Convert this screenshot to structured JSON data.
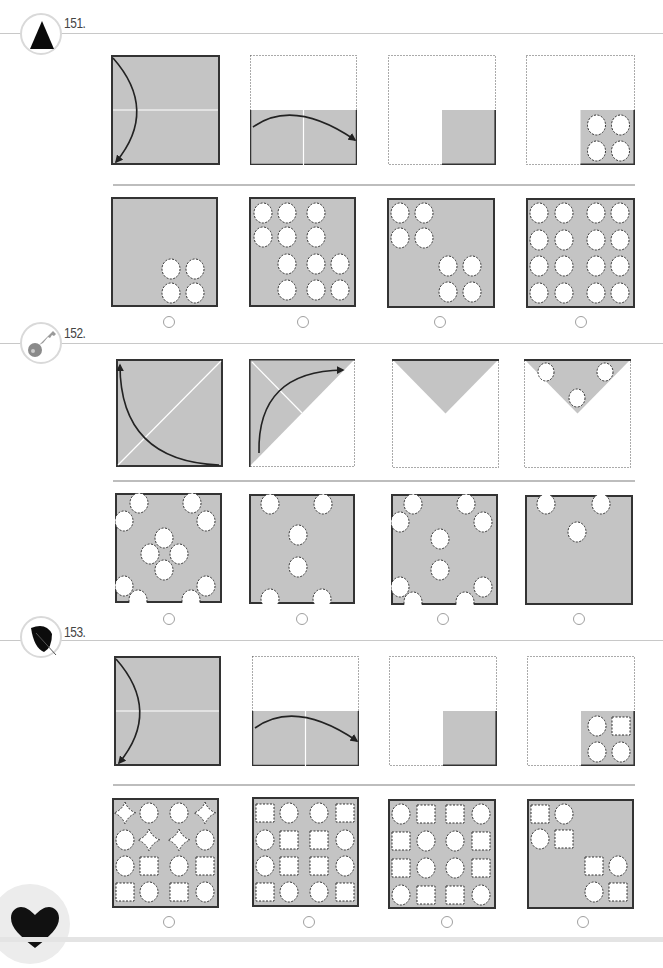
{
  "page": {
    "bg": "#ffffff",
    "paper_gray": "#c4c4c4",
    "ink": "#222222"
  },
  "questions": [
    {
      "number": "151.",
      "icon": "triangle-icon",
      "badge": {
        "x": 20,
        "y": 13
      },
      "num_pos": {
        "x": 64,
        "y": 23
      },
      "line_y": 33,
      "sequence": [
        {
          "type": "fold-h-down",
          "x": 111,
          "y": 55,
          "w": 109,
          "h": 110
        },
        {
          "type": "fold-v-right",
          "x": 250,
          "y": 55,
          "w": 107,
          "h": 110
        },
        {
          "type": "quarter",
          "x": 388,
          "y": 55,
          "w": 108,
          "h": 110
        },
        {
          "type": "quarter-holes",
          "x": 526,
          "y": 55,
          "w": 109,
          "h": 110,
          "holes": "cccc"
        }
      ],
      "sep_y": 184,
      "answers": [
        {
          "x": 111,
          "y": 197,
          "w": 107,
          "h": 110,
          "holes": [
            [
              60,
              72,
              "c"
            ],
            [
              84,
              72,
              "c"
            ],
            [
              60,
              96,
              "c"
            ],
            [
              84,
              96,
              "c"
            ]
          ]
        },
        {
          "x": 249,
          "y": 197,
          "w": 107,
          "h": 110,
          "holes": [
            [
              14,
              16,
              "c"
            ],
            [
              38,
              16,
              "c"
            ],
            [
              67,
              16,
              "c"
            ],
            [
              14,
              40,
              "c"
            ],
            [
              38,
              40,
              "c"
            ],
            [
              67,
              40,
              "c"
            ],
            [
              38,
              67,
              "c"
            ],
            [
              67,
              67,
              "c"
            ],
            [
              91,
              67,
              "c"
            ],
            [
              38,
              93,
              "c"
            ],
            [
              67,
              93,
              "c"
            ],
            [
              91,
              93,
              "c"
            ]
          ]
        },
        {
          "x": 387,
          "y": 198,
          "w": 108,
          "h": 110,
          "holes": [
            [
              13,
              15,
              "c"
            ],
            [
              37,
              15,
              "c"
            ],
            [
              13,
              40,
              "c"
            ],
            [
              37,
              40,
              "c"
            ],
            [
              61,
              68,
              "c"
            ],
            [
              85,
              68,
              "c"
            ],
            [
              61,
              94,
              "c"
            ],
            [
              85,
              94,
              "c"
            ]
          ]
        },
        {
          "x": 526,
          "y": 198,
          "w": 109,
          "h": 110,
          "holes": [
            [
              13,
              15,
              "c"
            ],
            [
              38,
              15,
              "c"
            ],
            [
              70,
              15,
              "c"
            ],
            [
              94,
              15,
              "c"
            ],
            [
              13,
              42,
              "c"
            ],
            [
              38,
              42,
              "c"
            ],
            [
              70,
              42,
              "c"
            ],
            [
              94,
              42,
              "c"
            ],
            [
              13,
              68,
              "c"
            ],
            [
              38,
              68,
              "c"
            ],
            [
              70,
              68,
              "c"
            ],
            [
              94,
              68,
              "c"
            ],
            [
              13,
              95,
              "c"
            ],
            [
              38,
              95,
              "c"
            ],
            [
              70,
              95,
              "c"
            ],
            [
              94,
              95,
              "c"
            ]
          ]
        }
      ],
      "radios_y": 316,
      "radios_x": [
        163,
        297,
        434,
        575
      ]
    },
    {
      "number": "152.",
      "icon": "key-icon",
      "badge": {
        "x": 20,
        "y": 322
      },
      "num_pos": {
        "x": 64,
        "y": 333
      },
      "line_y": 343,
      "sequence": [
        {
          "type": "diag-fold",
          "x": 116,
          "y": 359,
          "w": 107,
          "h": 108
        },
        {
          "type": "tri-fold",
          "x": 249,
          "y": 359,
          "w": 106,
          "h": 108
        },
        {
          "type": "down-tri",
          "x": 392,
          "y": 359,
          "w": 107,
          "h": 109
        },
        {
          "type": "down-tri-holes",
          "x": 524,
          "y": 359,
          "w": 107,
          "h": 109
        }
      ],
      "sep_y": 480,
      "answers": [
        {
          "x": 115,
          "y": 493,
          "w": 107,
          "h": 110,
          "holes": [
            [
              24,
              10,
              "c"
            ],
            [
              77,
              10,
              "c"
            ],
            [
              9,
              28,
              "c"
            ],
            [
              91,
              28,
              "c"
            ],
            [
              49,
              45,
              "c"
            ],
            [
              35,
              61,
              "c"
            ],
            [
              64,
              61,
              "c"
            ],
            [
              49,
              77,
              "c"
            ],
            [
              9,
              93,
              "c"
            ],
            [
              91,
              93,
              "c"
            ],
            [
              23,
              107,
              "c"
            ],
            [
              76,
              107,
              "c"
            ]
          ]
        },
        {
          "x": 249,
          "y": 494,
          "w": 106,
          "h": 110,
          "holes": [
            [
              21,
              10,
              "c"
            ],
            [
              74,
              10,
              "c"
            ],
            [
              49,
              41,
              "c"
            ],
            [
              49,
              73,
              "c"
            ],
            [
              21,
              105,
              "c"
            ],
            [
              73,
              105,
              "c"
            ]
          ]
        },
        {
          "x": 391,
          "y": 494,
          "w": 107,
          "h": 111,
          "holes": [
            [
              22,
              10,
              "c"
            ],
            [
              75,
              10,
              "c"
            ],
            [
              9,
              28,
              "c"
            ],
            [
              92,
              28,
              "c"
            ],
            [
              49,
              45,
              "c"
            ],
            [
              49,
              76,
              "c"
            ],
            [
              9,
              93,
              "c"
            ],
            [
              92,
              93,
              "c"
            ],
            [
              22,
              108,
              "c"
            ],
            [
              74,
              108,
              "c"
            ]
          ]
        },
        {
          "x": 525,
          "y": 495,
          "w": 108,
          "h": 110,
          "holes": [
            [
              21,
              9,
              "c"
            ],
            [
              76,
              9,
              "c"
            ],
            [
              52,
              37,
              "c"
            ]
          ]
        }
      ],
      "radios_y": 613,
      "radios_x": [
        163,
        296,
        437,
        573
      ]
    },
    {
      "number": "153.",
      "icon": "leaf-icon",
      "badge": {
        "x": 20,
        "y": 616
      },
      "num_pos": {
        "x": 64,
        "y": 632
      },
      "line_y": 640,
      "sequence": [
        {
          "type": "fold-h-down",
          "x": 114,
          "y": 656,
          "w": 107,
          "h": 110
        },
        {
          "type": "fold-v-right",
          "x": 252,
          "y": 656,
          "w": 107,
          "h": 110
        },
        {
          "type": "quarter",
          "x": 389,
          "y": 656,
          "w": 108,
          "h": 110
        },
        {
          "type": "quarter-holes",
          "x": 527,
          "y": 656,
          "w": 108,
          "h": 110,
          "holes": "csqc"
        }
      ],
      "sep_y": 784,
      "answers": [
        {
          "x": 112,
          "y": 798,
          "w": 107,
          "h": 110,
          "holes": [
            [
              13,
              15,
              "d"
            ],
            [
              37,
              15,
              "c"
            ],
            [
              67,
              15,
              "c"
            ],
            [
              93,
              15,
              "d"
            ],
            [
              13,
              42,
              "c"
            ],
            [
              37,
              42,
              "d"
            ],
            [
              67,
              42,
              "d"
            ],
            [
              93,
              42,
              "c"
            ],
            [
              13,
              68,
              "c"
            ],
            [
              37,
              68,
              "s"
            ],
            [
              67,
              68,
              "c"
            ],
            [
              93,
              68,
              "s"
            ],
            [
              13,
              94,
              "s"
            ],
            [
              37,
              94,
              "c"
            ],
            [
              67,
              94,
              "s"
            ],
            [
              93,
              94,
              "c"
            ]
          ]
        },
        {
          "x": 252,
          "y": 797,
          "w": 107,
          "h": 110,
          "holes": [
            [
              13,
              16,
              "s"
            ],
            [
              37,
              16,
              "c"
            ],
            [
              67,
              16,
              "c"
            ],
            [
              93,
              16,
              "s"
            ],
            [
              13,
              43,
              "c"
            ],
            [
              37,
              43,
              "s"
            ],
            [
              67,
              43,
              "s"
            ],
            [
              93,
              43,
              "c"
            ],
            [
              13,
              69,
              "c"
            ],
            [
              37,
              69,
              "s"
            ],
            [
              67,
              69,
              "s"
            ],
            [
              93,
              69,
              "c"
            ],
            [
              13,
              95,
              "s"
            ],
            [
              37,
              95,
              "c"
            ],
            [
              67,
              95,
              "c"
            ],
            [
              93,
              95,
              "s"
            ]
          ]
        },
        {
          "x": 388,
          "y": 799,
          "w": 108,
          "h": 110,
          "holes": [
            [
              13,
              15,
              "c"
            ],
            [
              38,
              15,
              "s"
            ],
            [
              67,
              15,
              "s"
            ],
            [
              93,
              15,
              "c"
            ],
            [
              13,
              42,
              "s"
            ],
            [
              38,
              42,
              "c"
            ],
            [
              67,
              42,
              "c"
            ],
            [
              93,
              42,
              "s"
            ],
            [
              13,
              69,
              "s"
            ],
            [
              38,
              69,
              "c"
            ],
            [
              67,
              69,
              "c"
            ],
            [
              93,
              69,
              "s"
            ],
            [
              13,
              96,
              "c"
            ],
            [
              38,
              96,
              "s"
            ],
            [
              67,
              96,
              "s"
            ],
            [
              93,
              96,
              "c"
            ]
          ]
        },
        {
          "x": 527,
          "y": 799,
          "w": 107,
          "h": 110,
          "holes": [
            [
              13,
              15,
              "s"
            ],
            [
              37,
              15,
              "c"
            ],
            [
              13,
              40,
              "c"
            ],
            [
              37,
              40,
              "s"
            ],
            [
              67,
              67,
              "s"
            ],
            [
              91,
              67,
              "c"
            ],
            [
              67,
              93,
              "c"
            ],
            [
              91,
              93,
              "s"
            ]
          ]
        }
      ],
      "radios_y": 916,
      "radios_x": [
        163,
        303,
        441,
        577
      ]
    }
  ],
  "footer": {
    "icon": "heart-icon"
  }
}
